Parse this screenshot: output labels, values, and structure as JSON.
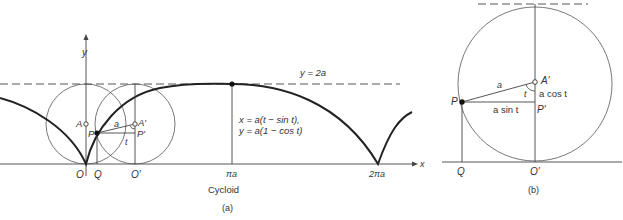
{
  "panel_a": {
    "labels": {
      "y_axis": "y",
      "x_axis": "x",
      "line_2a": "y = 2a",
      "eq1": "x = a(t − sin t),",
      "eq2": "y = a(1 − cos t)",
      "A": "A",
      "A_prime": "A′",
      "P": "P",
      "P_prime": "P′",
      "a": "a",
      "t": "t",
      "O": "O",
      "Q": "Q",
      "O_prime": "O′",
      "pi_a": "πa",
      "two_pi_a": "2πa",
      "title": "Cycloid",
      "caption": "(a)"
    }
  },
  "panel_b": {
    "labels": {
      "A_prime": "A′",
      "a": "a",
      "t": "t",
      "a_cos_t": "a cos t",
      "P": "P",
      "a_sin_t": "a sin t",
      "P_prime": "P′",
      "Q": "Q",
      "O_prime": "O′",
      "caption": "(b)"
    }
  },
  "colors": {
    "curve": "#222222",
    "thin": "#444444"
  }
}
